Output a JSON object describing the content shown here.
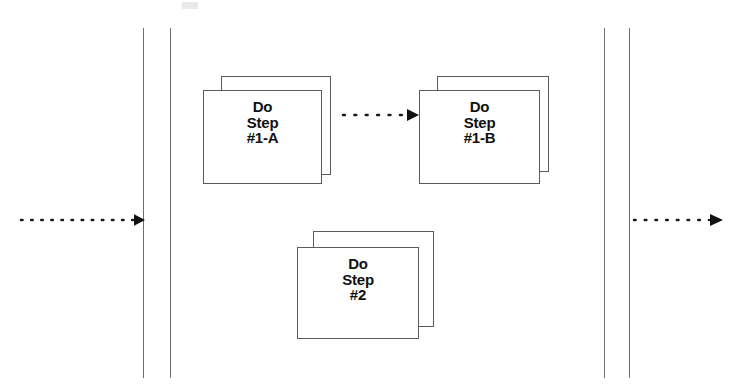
{
  "diagram": {
    "type": "flowchart",
    "background_color": "#ffffff",
    "line_color": "#5a5a5a",
    "rule_color": "#6e6e6e",
    "text_color": "#111111"
  },
  "lanes": [
    {
      "name": "left-outer-boundary",
      "x": 143,
      "y": 28,
      "height": 350
    },
    {
      "name": "left-inner-boundary",
      "x": 170,
      "y": 28,
      "height": 350
    },
    {
      "name": "right-inner-boundary",
      "x": 604,
      "y": 28,
      "height": 350
    },
    {
      "name": "right-outer-boundary",
      "x": 629,
      "y": 28,
      "height": 350
    }
  ],
  "nodes": [
    {
      "id": "step-1a",
      "label": "Do\nStep\n#1-A",
      "line1": "Do",
      "line2": "Step",
      "line3": "#1-A",
      "shape": "stacked-document",
      "back": {
        "x": 221,
        "y": 76,
        "width": 110,
        "height": 99
      },
      "front": {
        "x": 203,
        "y": 90,
        "width": 119,
        "height": 94
      },
      "label_box": {
        "x": 203,
        "y": 99,
        "width": 119
      }
    },
    {
      "id": "step-1b",
      "label": "Do\nStep\n#1-B",
      "line1": "Do",
      "line2": "Step",
      "line3": "#1-B",
      "shape": "stacked-document",
      "back": {
        "x": 437,
        "y": 76,
        "width": 112,
        "height": 96
      },
      "front": {
        "x": 419,
        "y": 90,
        "width": 121,
        "height": 94
      },
      "label_box": {
        "x": 419,
        "y": 99,
        "width": 121
      }
    },
    {
      "id": "step-2",
      "label": "Do\nStep\n#2",
      "line1": "Do",
      "line2": "Step",
      "line3": "#2",
      "shape": "stacked-document",
      "back": {
        "x": 313,
        "y": 231,
        "width": 121,
        "height": 96
      },
      "front": {
        "x": 297,
        "y": 247,
        "width": 122,
        "height": 92
      },
      "label_box": {
        "x": 297,
        "y": 256,
        "width": 122
      }
    }
  ],
  "arrows": [
    {
      "id": "arrow-entry",
      "name": "entry-arrow",
      "style": "dotted",
      "direction": "right",
      "y": 220,
      "x_start": 21,
      "x_end": 143,
      "dot_count": 12,
      "arrowhead": true
    },
    {
      "id": "arrow-1a-to-1b",
      "name": "arrow-step1a-to-step1b",
      "style": "dotted",
      "direction": "right",
      "y": 115,
      "x_start": 343,
      "x_end": 418,
      "dot_count": 6,
      "arrowhead": true
    },
    {
      "id": "arrow-exit",
      "name": "exit-arrow",
      "style": "dotted",
      "direction": "right",
      "y": 220,
      "x_start": 634,
      "x_end": 722,
      "dot_count": 8,
      "arrowhead": true
    }
  ],
  "artifacts": [
    {
      "name": "scan-smudge",
      "x": 182,
      "y": 2,
      "width": 16,
      "height": 7
    }
  ]
}
